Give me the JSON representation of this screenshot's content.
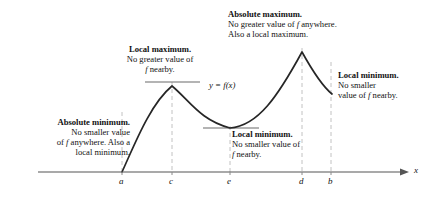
{
  "figure": {
    "type": "calculus-extrema-diagram",
    "axis": {
      "x_label": "x",
      "tick_labels": [
        "a",
        "c",
        "e",
        "d",
        "b"
      ],
      "tick_positions": [
        122,
        172,
        230,
        302,
        331
      ],
      "axis_y": 172,
      "axis_x_start": 38,
      "axis_x_end": 404
    },
    "curve_label": "y = f(x)",
    "annotations": {
      "absolute_maximum": {
        "heading": "Absolute maximum.",
        "line1": "No greater value of f anywhere.",
        "line2": "Also a local maximum."
      },
      "local_maximum": {
        "heading": "Local maximum.",
        "line1": "No greater value of",
        "line2": "f nearby."
      },
      "absolute_minimum": {
        "heading": "Absolute minimum.",
        "line1": "No smaller value",
        "line2": "of f anywhere. Also a",
        "line3": "local minimum."
      },
      "local_minimum_middle": {
        "heading": "Local minimum.",
        "line1": "No smaller value of",
        "line2": "f nearby."
      },
      "local_minimum_right": {
        "heading": "Local minimum.",
        "line1": "No smaller",
        "line2": "value of f nearby."
      }
    },
    "colors": {
      "curve": "#262626",
      "axis": "#555555",
      "dashed": "#bdbdbd",
      "tangent": "#6b6b6b",
      "text": "#111111"
    }
  },
  "chart_data": {
    "type": "line",
    "title": "",
    "xlabel": "x",
    "ylabel": "",
    "grid": false,
    "legend": "none",
    "annotated_points": [
      {
        "label": "a",
        "x": 122,
        "kind": "absolute minimum / local minimum",
        "endpoint": true
      },
      {
        "label": "c",
        "x": 172,
        "kind": "local maximum"
      },
      {
        "label": "e",
        "x": 230,
        "kind": "local minimum"
      },
      {
        "label": "d",
        "x": 302,
        "kind": "absolute maximum / local maximum"
      },
      {
        "label": "b",
        "x": 331,
        "kind": "local minimum",
        "endpoint": true
      }
    ],
    "curve_points": [
      [
        122,
        172
      ],
      [
        132,
        150
      ],
      [
        142,
        128
      ],
      [
        152,
        108
      ],
      [
        162,
        93
      ],
      [
        172,
        86
      ],
      [
        182,
        89
      ],
      [
        192,
        99
      ],
      [
        202,
        112
      ],
      [
        212,
        122
      ],
      [
        222,
        127
      ],
      [
        230,
        128
      ],
      [
        240,
        126
      ],
      [
        250,
        119
      ],
      [
        260,
        108
      ],
      [
        270,
        95
      ],
      [
        280,
        80
      ],
      [
        290,
        66
      ],
      [
        302,
        52
      ],
      [
        310,
        65
      ],
      [
        318,
        78
      ],
      [
        326,
        88
      ],
      [
        332,
        94
      ]
    ]
  }
}
